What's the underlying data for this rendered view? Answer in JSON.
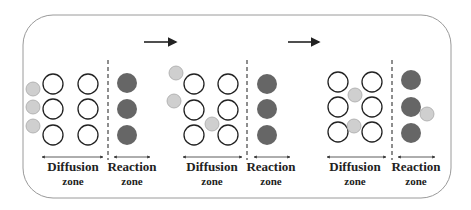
{
  "diagram": {
    "title": "",
    "colors": {
      "frame": "#9a9a9a",
      "outline_circle_stroke": "#222222",
      "reactant_fill": "#cfcfcf",
      "reactant_stroke": "#a8a8a8",
      "reaction_site_fill": "#666666",
      "arrow": "#222222",
      "dashed_divider": "#444444"
    },
    "arrows": [
      {
        "label": "",
        "x1": 144,
        "x2": 180,
        "y": 42
      },
      {
        "label": "",
        "x1": 288,
        "x2": 323,
        "y": 42
      }
    ],
    "panels": [
      {
        "name": "stage-1",
        "open_circles": [
          [
            53,
            84
          ],
          [
            88,
            84
          ],
          [
            53,
            109
          ],
          [
            88,
            109
          ],
          [
            53,
            135
          ],
          [
            88,
            135
          ]
        ],
        "reactants": [
          [
            33,
            89
          ],
          [
            33,
            107
          ],
          [
            33,
            126
          ]
        ],
        "reaction_sites": [
          [
            127,
            83
          ],
          [
            127,
            109
          ],
          [
            127,
            135
          ]
        ],
        "divider_x": 108,
        "diffusion_arrow": [
          42,
          103
        ],
        "reaction_arrow": [
          114,
          150
        ],
        "diffusion_label": {
          "x": 73,
          "title": "Diffusion",
          "sub": "zone"
        },
        "reaction_label": {
          "x": 132,
          "title": "Reaction",
          "sub": "zone"
        }
      },
      {
        "name": "stage-2",
        "open_circles": [
          [
            194,
            84
          ],
          [
            228,
            84
          ],
          [
            194,
            110
          ],
          [
            228,
            110
          ],
          [
            194,
            135
          ],
          [
            228,
            135
          ]
        ],
        "reactants": [
          [
            176,
            73
          ],
          [
            174,
            101
          ],
          [
            212,
            124
          ]
        ],
        "reaction_sites": [
          [
            267,
            84
          ],
          [
            267,
            109
          ],
          [
            267,
            135
          ]
        ],
        "divider_x": 247,
        "diffusion_arrow": [
          183,
          242
        ],
        "reaction_arrow": [
          254,
          290
        ],
        "diffusion_label": {
          "x": 212,
          "title": "Diffusion",
          "sub": "zone"
        },
        "reaction_label": {
          "x": 271,
          "title": "Reaction",
          "sub": "zone"
        }
      },
      {
        "name": "stage-3",
        "open_circles": [
          [
            338,
            82
          ],
          [
            372,
            82
          ],
          [
            338,
            107
          ],
          [
            372,
            107
          ],
          [
            338,
            132
          ],
          [
            372,
            132
          ]
        ],
        "reactants": [
          [
            355,
            95
          ],
          [
            354,
            126
          ],
          [
            427,
            114
          ]
        ],
        "reaction_sites": [
          [
            411,
            80
          ],
          [
            411,
            107
          ],
          [
            411,
            133
          ]
        ],
        "divider_x": 392,
        "diffusion_arrow": [
          327,
          386
        ],
        "reaction_arrow": [
          398,
          435
        ],
        "diffusion_label": {
          "x": 355,
          "title": "Diffusion",
          "sub": "zone"
        },
        "reaction_label": {
          "x": 416,
          "title": "Reaction",
          "sub": "zone"
        }
      }
    ]
  }
}
